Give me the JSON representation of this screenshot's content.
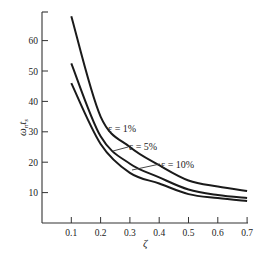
{
  "chart_data": {
    "type": "line",
    "title": "",
    "xlabel": "ζ",
    "ylabel": "ω_n t_s",
    "xlim": [
      0,
      0.7
    ],
    "ylim": [
      0,
      70
    ],
    "grid": false,
    "x_ticks": [
      "0.1",
      "0.2",
      "0.3",
      "0.4",
      "0.5",
      "0.6",
      "0.7"
    ],
    "y_ticks": [
      "10",
      "20",
      "30",
      "40",
      "50",
      "60"
    ],
    "x": [
      0.1,
      0.2,
      0.3,
      0.4,
      0.5,
      0.6,
      0.7
    ],
    "series": [
      {
        "name": "ε = 1%",
        "values": [
          68,
          35,
          25,
          19,
          14,
          12,
          10.5
        ]
      },
      {
        "name": "ε = 5%",
        "values": [
          52.5,
          28.5,
          19.5,
          15,
          11,
          9.2,
          8.2
        ]
      },
      {
        "name": "ε = 10%",
        "values": [
          46,
          26,
          16.5,
          13,
          9.5,
          8.2,
          7.2
        ]
      }
    ],
    "annotations": [
      "ε = 1%",
      "ε = 5%",
      "ε = 10%"
    ]
  },
  "axes": {
    "x_label": "ζ",
    "y_label_main": "ω",
    "y_label_sub1": "n",
    "y_label_t": "t",
    "y_label_sub2": "s"
  },
  "labels": {
    "eps1": "ε = 1%",
    "eps5": "ε = 5%",
    "eps10": "ε = 10%"
  }
}
